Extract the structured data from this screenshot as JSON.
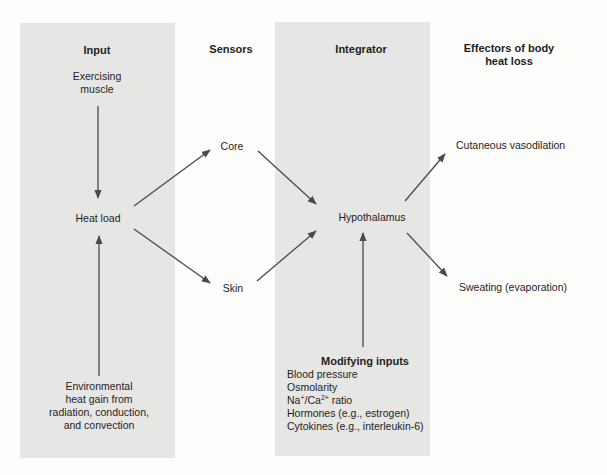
{
  "columns": {
    "input": {
      "heading": "Input"
    },
    "sensors": {
      "heading": "Sensors"
    },
    "integrator": {
      "heading": "Integrator"
    },
    "effectors": {
      "heading_line1": "Effectors of body",
      "heading_line2": "heat loss"
    }
  },
  "nodes": {
    "exercising_muscle": {
      "line1": "Exercising",
      "line2": "muscle"
    },
    "heat_load": "Heat load",
    "environmental": {
      "line1": "Environmental",
      "line2": "heat gain from",
      "line3": "radiation, conduction,",
      "line4": "and convection"
    },
    "core": "Core",
    "skin": "Skin",
    "hypothalamus": "Hypothalamus",
    "cutaneous_vasodilation": "Cutaneous vasodilation",
    "sweating": "Sweating (evaporation)"
  },
  "modifying_inputs": {
    "heading": "Modifying inputs",
    "items": [
      "Blood pressure",
      "Osmolarity",
      {
        "base1": "Na",
        "sup1": "+",
        "mid": "/Ca",
        "sup2": "2+",
        "tail": " ratio"
      },
      "Hormones (e.g., estrogen)",
      "Cytokines (e.g., interleukin-6)"
    ]
  },
  "edges": [
    {
      "from": "Exercising muscle",
      "to": "Heat load"
    },
    {
      "from": "Environmental heat gain",
      "to": "Heat load"
    },
    {
      "from": "Heat load",
      "to": "Core"
    },
    {
      "from": "Heat load",
      "to": "Skin"
    },
    {
      "from": "Core",
      "to": "Hypothalamus"
    },
    {
      "from": "Skin",
      "to": "Hypothalamus"
    },
    {
      "from": "Modifying inputs",
      "to": "Hypothalamus"
    },
    {
      "from": "Hypothalamus",
      "to": "Cutaneous vasodilation"
    },
    {
      "from": "Hypothalamus",
      "to": "Sweating (evaporation)"
    }
  ],
  "colors": {
    "panel": "#e6e6e4",
    "background": "#fdfdfc",
    "arrow": "#4a4a4a",
    "text": "#1e1e1e"
  }
}
